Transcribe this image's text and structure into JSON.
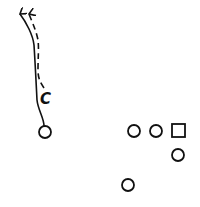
{
  "diagram": {
    "type": "football-play",
    "stroke_color": "#111111",
    "background": "#ffffff",
    "labels": {
      "receiver_label": "C"
    },
    "players": [
      {
        "id": "left-receiver",
        "shape": "circle",
        "cx": 45,
        "cy": 132
      },
      {
        "id": "player-2",
        "shape": "circle",
        "cx": 134,
        "cy": 131
      },
      {
        "id": "player-3",
        "shape": "circle",
        "cx": 156,
        "cy": 131
      },
      {
        "id": "center",
        "shape": "square",
        "cx": 178,
        "cy": 131
      },
      {
        "id": "quarterback",
        "shape": "circle",
        "cx": 178,
        "cy": 155
      },
      {
        "id": "back",
        "shape": "circle",
        "cx": 128,
        "cy": 185
      }
    ],
    "routes": [
      {
        "id": "solid-route",
        "style": "solid",
        "arrow": true
      },
      {
        "id": "dashed-route",
        "style": "dashed",
        "arrow": true
      }
    ]
  }
}
